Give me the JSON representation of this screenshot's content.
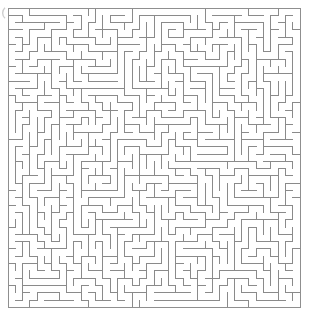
{
  "puzzle": {
    "kind": "maze-puzzle",
    "title": "Maze",
    "type": "orthogonal-perfect-maze",
    "colors": {
      "background": "#ffffff",
      "wall": "#8a8a8a",
      "border": "#8f8f8f",
      "artifact": "#cfcfcf"
    },
    "geometry": {
      "image_width": 311,
      "image_height": 326,
      "origin_x": 8,
      "origin_y": 8,
      "cell_size": 7.3,
      "cols": 40,
      "rows": 41,
      "wall_thickness": 1
    },
    "artifact": {
      "name": "clipped-arc",
      "cx": -2,
      "cy": 13,
      "r": 7,
      "note": "faint partial circle clipped at the left edge"
    },
    "seed": 20240517
  },
  "chart_data": {
    "type": "table",
    "categories": [
      "cols",
      "rows",
      "cell_size"
    ],
    "values": [
      40,
      41,
      7.3
    ]
  }
}
